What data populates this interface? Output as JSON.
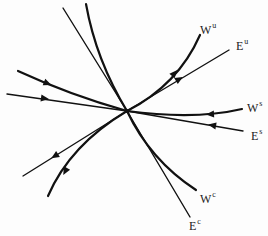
{
  "diagram": {
    "type": "invariant manifolds phase portrait",
    "center_point": {
      "x": 127,
      "y": 111
    },
    "colors": {
      "stroke": "#111111",
      "background": "#fdfdfd",
      "text": "#222222"
    },
    "labels": {
      "w_u": {
        "base": "W",
        "sup": "u"
      },
      "e_u": {
        "base": "E",
        "sup": "u"
      },
      "w_s": {
        "base": "W",
        "sup": "s"
      },
      "e_s": {
        "base": "E",
        "sup": "s"
      },
      "w_c": {
        "base": "W",
        "sup": "c"
      },
      "e_c": {
        "base": "E",
        "sup": "c"
      }
    },
    "curves": [
      {
        "name": "W^u",
        "kind": "curved manifold",
        "direction": "outward"
      },
      {
        "name": "E^u",
        "kind": "straight subspace",
        "direction": "outward"
      },
      {
        "name": "W^s",
        "kind": "curved manifold",
        "direction": "inward"
      },
      {
        "name": "E^s",
        "kind": "straight subspace",
        "direction": "inward"
      },
      {
        "name": "W^c",
        "kind": "curved manifold",
        "direction": "none"
      },
      {
        "name": "E^c",
        "kind": "straight subspace",
        "direction": "none"
      }
    ]
  }
}
